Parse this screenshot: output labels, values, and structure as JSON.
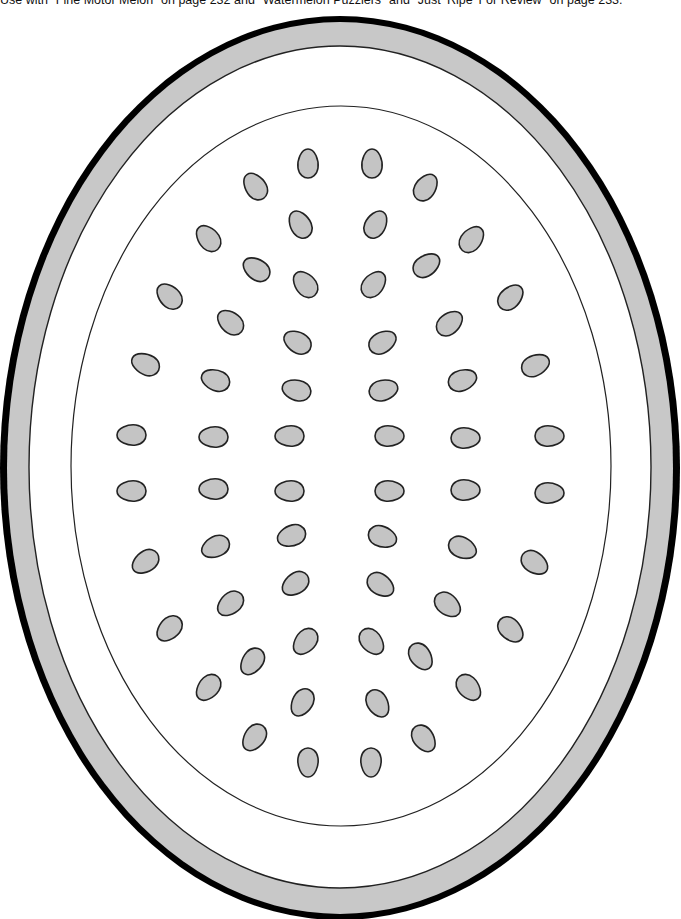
{
  "caption": "Use with \"Fine Motor Melon\" on page 232 and \"Watermelon Puzzlers\" and \"Just ‘Ripe’ For Review\" on page 233.",
  "colors": {
    "rind_outer": "#000000",
    "rind_band": "#c8c8c8",
    "flesh": "#ffffff",
    "seed_fill": "#c4c4c4",
    "seed_stroke": "#222222",
    "line": "#222222"
  },
  "melon": {
    "outer": {
      "cx": 340,
      "cy": 468,
      "rx": 340,
      "ry": 452
    },
    "band": {
      "cx": 340,
      "cy": 468,
      "rx": 333,
      "ry": 446
    },
    "white": {
      "cx": 340,
      "cy": 467,
      "rx": 311,
      "ry": 421
    },
    "inner": {
      "cx": 341,
      "cy": 466,
      "rx": 270,
      "ry": 360
    }
  },
  "seeds": [
    {
      "x": 308,
      "y": 163,
      "a": 0
    },
    {
      "x": 372,
      "y": 163,
      "a": 0
    },
    {
      "x": 255,
      "y": 186,
      "a": -35
    },
    {
      "x": 426,
      "y": 187,
      "a": 35
    },
    {
      "x": 300,
      "y": 224,
      "a": -30
    },
    {
      "x": 376,
      "y": 224,
      "a": 30
    },
    {
      "x": 208,
      "y": 238,
      "a": -40
    },
    {
      "x": 472,
      "y": 239,
      "a": 40
    },
    {
      "x": 256,
      "y": 269,
      "a": -55
    },
    {
      "x": 427,
      "y": 265,
      "a": 55
    },
    {
      "x": 305,
      "y": 284,
      "a": -40
    },
    {
      "x": 374,
      "y": 284,
      "a": 40
    },
    {
      "x": 169,
      "y": 296,
      "a": -45
    },
    {
      "x": 511,
      "y": 297,
      "a": 45
    },
    {
      "x": 230,
      "y": 322,
      "a": -50
    },
    {
      "x": 450,
      "y": 323,
      "a": 50
    },
    {
      "x": 297,
      "y": 342,
      "a": -60
    },
    {
      "x": 383,
      "y": 342,
      "a": 60
    },
    {
      "x": 145,
      "y": 364,
      "a": -65
    },
    {
      "x": 536,
      "y": 365,
      "a": 65
    },
    {
      "x": 215,
      "y": 380,
      "a": -70
    },
    {
      "x": 463,
      "y": 380,
      "a": 70
    },
    {
      "x": 296,
      "y": 390,
      "a": -75
    },
    {
      "x": 384,
      "y": 390,
      "a": 75
    },
    {
      "x": 131,
      "y": 435,
      "a": -90
    },
    {
      "x": 550,
      "y": 436,
      "a": 90
    },
    {
      "x": 213,
      "y": 437,
      "a": -90
    },
    {
      "x": 466,
      "y": 438,
      "a": 90
    },
    {
      "x": 289,
      "y": 436,
      "a": -90
    },
    {
      "x": 390,
      "y": 436,
      "a": 90
    },
    {
      "x": 131,
      "y": 491,
      "a": -90
    },
    {
      "x": 550,
      "y": 493,
      "a": 90
    },
    {
      "x": 213,
      "y": 489,
      "a": -90
    },
    {
      "x": 466,
      "y": 490,
      "a": 90
    },
    {
      "x": 289,
      "y": 491,
      "a": -90
    },
    {
      "x": 390,
      "y": 491,
      "a": 90
    },
    {
      "x": 291,
      "y": 536,
      "a": -110
    },
    {
      "x": 383,
      "y": 537,
      "a": 110
    },
    {
      "x": 215,
      "y": 547,
      "a": -115
    },
    {
      "x": 463,
      "y": 548,
      "a": 115
    },
    {
      "x": 145,
      "y": 562,
      "a": -125
    },
    {
      "x": 535,
      "y": 563,
      "a": 125
    },
    {
      "x": 295,
      "y": 584,
      "a": -125
    },
    {
      "x": 381,
      "y": 585,
      "a": 125
    },
    {
      "x": 230,
      "y": 604,
      "a": -130
    },
    {
      "x": 448,
      "y": 605,
      "a": 130
    },
    {
      "x": 169,
      "y": 629,
      "a": -135
    },
    {
      "x": 511,
      "y": 630,
      "a": 135
    },
    {
      "x": 305,
      "y": 642,
      "a": -140
    },
    {
      "x": 372,
      "y": 642,
      "a": 140
    },
    {
      "x": 252,
      "y": 662,
      "a": -145
    },
    {
      "x": 421,
      "y": 657,
      "a": 145
    },
    {
      "x": 208,
      "y": 688,
      "a": -140
    },
    {
      "x": 469,
      "y": 688,
      "a": 140
    },
    {
      "x": 302,
      "y": 703,
      "a": -150
    },
    {
      "x": 378,
      "y": 704,
      "a": 150
    },
    {
      "x": 254,
      "y": 738,
      "a": -145
    },
    {
      "x": 424,
      "y": 739,
      "a": 145
    },
    {
      "x": 308,
      "y": 763,
      "a": 180
    },
    {
      "x": 371,
      "y": 763,
      "a": 180
    }
  ]
}
